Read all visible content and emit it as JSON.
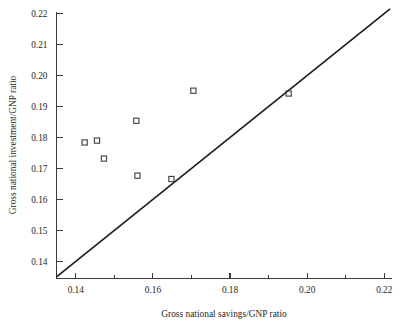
{
  "chart_data": {
    "type": "scatter",
    "title": "",
    "xlabel": "Gross national savings/GNP ratio",
    "ylabel": "Gross national investment/GNP ratio",
    "xlim": [
      0.135,
      0.222
    ],
    "ylim": [
      0.1345,
      0.2205
    ],
    "grid": false,
    "legend": "none",
    "x_ticks": [
      0.14,
      0.16,
      0.18,
      0.2,
      0.22
    ],
    "x_tick_labels": [
      "0.14",
      "0.16",
      "0.18",
      "0.20",
      "0.22"
    ],
    "x_minor_ticks": [
      0.15,
      0.17,
      0.19,
      0.21
    ],
    "y_ticks": [
      0.14,
      0.15,
      0.16,
      0.17,
      0.18,
      0.19,
      0.2,
      0.21,
      0.22
    ],
    "y_tick_labels": [
      "0.14",
      "0.15",
      "0.16",
      "0.17",
      "0.18",
      "0.19",
      "0.20",
      "0.21",
      "0.22"
    ],
    "marker_style": "open-square",
    "points": [
      {
        "x": 0.1423,
        "y": 0.1784
      },
      {
        "x": 0.1455,
        "y": 0.179
      },
      {
        "x": 0.1473,
        "y": 0.1732
      },
      {
        "x": 0.1557,
        "y": 0.1854
      },
      {
        "x": 0.156,
        "y": 0.1677
      },
      {
        "x": 0.1648,
        "y": 0.1666
      },
      {
        "x": 0.1705,
        "y": 0.1951
      },
      {
        "x": 0.1952,
        "y": 0.1942
      }
    ],
    "annotations": [
      {
        "name": "forty-five-degree-line",
        "type": "line",
        "from": {
          "x": 0.135,
          "y": 0.135
        },
        "to": {
          "x": 0.2215,
          "y": 0.2215
        },
        "description": "45-degree reference line where savings equals investment"
      }
    ]
  },
  "axes": {
    "x_title": "Gross national savings/GNP ratio",
    "y_title": "Gross national investment/GNP ratio"
  },
  "colors": {
    "axis": "#3a3a3a",
    "line": "#1a1a1a",
    "marker": "#444444",
    "text": "#222222",
    "background": "#ffffff"
  }
}
